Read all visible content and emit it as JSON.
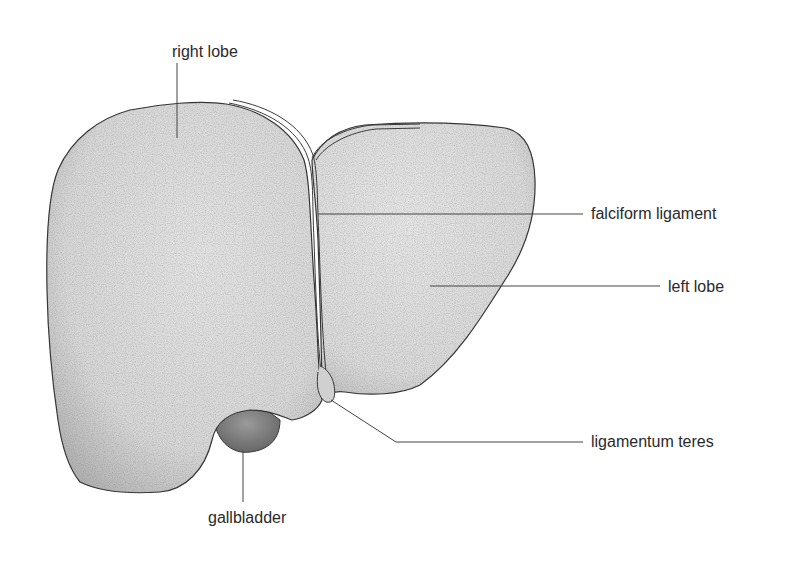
{
  "diagram": {
    "colors": {
      "fill": "#dcdcdc",
      "fill_dark": "#b8b8b8",
      "outline": "#3a3a3a",
      "leader": "#444444",
      "text": "#2a2a2a",
      "background": "#ffffff"
    },
    "labels": [
      {
        "id": "right-lobe",
        "text": "right lobe"
      },
      {
        "id": "falciform-ligament",
        "text": "falciform ligament"
      },
      {
        "id": "left-lobe",
        "text": "left lobe"
      },
      {
        "id": "ligamentum-teres",
        "text": "ligamentum teres"
      },
      {
        "id": "gallbladder",
        "text": "gallbladder"
      }
    ]
  }
}
